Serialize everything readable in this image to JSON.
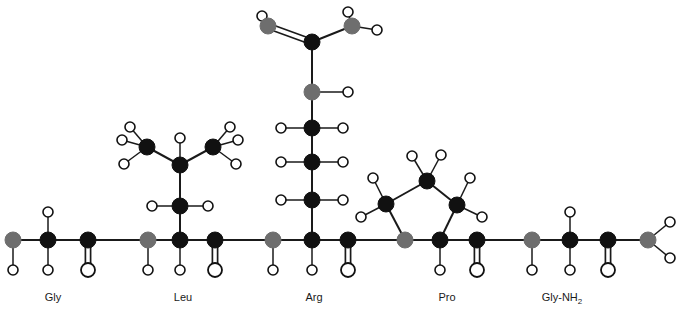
{
  "figure": {
    "width": 679,
    "height": 313,
    "background": "#ffffff"
  },
  "style": {
    "carbon_color": "#111111",
    "nitrogen_color": "#6e6e6e",
    "nitrogen_dark_color": "#4a4a4a",
    "hydrogen_fill": "#ffffff",
    "hydrogen_stroke": "#111111",
    "oxygen_fill": "#ffffff",
    "oxygen_stroke": "#111111",
    "bond_color": "#1a1a1a",
    "carbon_radius": 8,
    "nitrogen_radius": 8,
    "hydrogen_radius": 5,
    "oxygen_radius": 7,
    "bond_width": 2
  },
  "labels": [
    {
      "id": "label-gly",
      "text": "Gly",
      "sub": "",
      "x": 53,
      "y": 301
    },
    {
      "id": "label-leu",
      "text": "Leu",
      "sub": "",
      "x": 183,
      "y": 301
    },
    {
      "id": "label-arg",
      "text": "Arg",
      "sub": "",
      "x": 314,
      "y": 301
    },
    {
      "id": "label-pro",
      "text": "Pro",
      "sub": "",
      "x": 447,
      "y": 301
    },
    {
      "id": "label-gly-nh2",
      "text": "Gly-NH",
      "sub": "2",
      "x": 562,
      "y": 301
    }
  ],
  "atoms": [
    {
      "id": "n-term-n",
      "element": "N",
      "x": 13,
      "y": 240,
      "name": "n-terminal-nitrogen"
    },
    {
      "id": "gly-ca",
      "element": "C",
      "x": 48,
      "y": 240,
      "name": "gly-alpha-carbon"
    },
    {
      "id": "gly-co",
      "element": "C",
      "x": 88,
      "y": 240,
      "name": "gly-carbonyl-carbon"
    },
    {
      "id": "gly-o",
      "element": "O",
      "x": 88,
      "y": 270,
      "name": "gly-carbonyl-oxygen"
    },
    {
      "id": "leu-n",
      "element": "N",
      "x": 148,
      "y": 240,
      "name": "leu-amide-nitrogen"
    },
    {
      "id": "leu-ca",
      "element": "C",
      "x": 180,
      "y": 240,
      "name": "leu-alpha-carbon"
    },
    {
      "id": "leu-co",
      "element": "C",
      "x": 215,
      "y": 240,
      "name": "leu-carbonyl-carbon"
    },
    {
      "id": "leu-o",
      "element": "O",
      "x": 215,
      "y": 270,
      "name": "leu-carbonyl-oxygen"
    },
    {
      "id": "leu-cb",
      "element": "C",
      "x": 180,
      "y": 206,
      "name": "leu-beta-carbon"
    },
    {
      "id": "leu-cg",
      "element": "C",
      "x": 180,
      "y": 165,
      "name": "leu-gamma-carbon"
    },
    {
      "id": "leu-cd1",
      "element": "C",
      "x": 147,
      "y": 147,
      "name": "leu-delta1-methyl-carbon"
    },
    {
      "id": "leu-cd2",
      "element": "C",
      "x": 213,
      "y": 147,
      "name": "leu-delta2-methyl-carbon"
    },
    {
      "id": "arg-n",
      "element": "N",
      "x": 273,
      "y": 240,
      "name": "arg-amide-nitrogen"
    },
    {
      "id": "arg-ca",
      "element": "C",
      "x": 312,
      "y": 240,
      "name": "arg-alpha-carbon"
    },
    {
      "id": "arg-co",
      "element": "C",
      "x": 348,
      "y": 240,
      "name": "arg-carbonyl-carbon"
    },
    {
      "id": "arg-o",
      "element": "O",
      "x": 348,
      "y": 270,
      "name": "arg-carbonyl-oxygen"
    },
    {
      "id": "arg-cb",
      "element": "C",
      "x": 312,
      "y": 200,
      "name": "arg-beta-carbon"
    },
    {
      "id": "arg-cg",
      "element": "C",
      "x": 312,
      "y": 162,
      "name": "arg-gamma-carbon"
    },
    {
      "id": "arg-cd",
      "element": "C",
      "x": 312,
      "y": 128,
      "name": "arg-delta-carbon"
    },
    {
      "id": "arg-ne",
      "element": "N",
      "x": 312,
      "y": 92,
      "name": "arg-epsilon-nitrogen"
    },
    {
      "id": "arg-cz",
      "element": "C",
      "x": 312,
      "y": 42,
      "name": "arg-zeta-guanidinium-carbon"
    },
    {
      "id": "arg-nh1",
      "element": "N",
      "x": 268,
      "y": 26,
      "name": "arg-nh1-nitrogen"
    },
    {
      "id": "arg-nh2",
      "element": "N",
      "x": 352,
      "y": 26,
      "name": "arg-nh2-nitrogen"
    },
    {
      "id": "pro-n",
      "element": "N",
      "x": 405,
      "y": 240,
      "name": "pro-ring-nitrogen"
    },
    {
      "id": "pro-ca",
      "element": "C",
      "x": 440,
      "y": 240,
      "name": "pro-alpha-carbon"
    },
    {
      "id": "pro-co",
      "element": "C",
      "x": 477,
      "y": 240,
      "name": "pro-carbonyl-carbon"
    },
    {
      "id": "pro-o",
      "element": "O",
      "x": 477,
      "y": 270,
      "name": "pro-carbonyl-oxygen"
    },
    {
      "id": "pro-cd",
      "element": "C",
      "x": 386,
      "y": 204,
      "name": "pro-delta-carbon"
    },
    {
      "id": "pro-cg",
      "element": "C",
      "x": 427,
      "y": 181,
      "name": "pro-gamma-carbon"
    },
    {
      "id": "pro-cb",
      "element": "C",
      "x": 457,
      "y": 205,
      "name": "pro-beta-carbon"
    },
    {
      "id": "gly2-n",
      "element": "N",
      "x": 532,
      "y": 240,
      "name": "gly2-amide-nitrogen"
    },
    {
      "id": "gly2-ca",
      "element": "C",
      "x": 570,
      "y": 240,
      "name": "gly2-alpha-carbon"
    },
    {
      "id": "gly2-co",
      "element": "C",
      "x": 608,
      "y": 240,
      "name": "gly2-carbonyl-carbon"
    },
    {
      "id": "gly2-o",
      "element": "O",
      "x": 608,
      "y": 270,
      "name": "gly2-carbonyl-oxygen"
    },
    {
      "id": "c-term-n",
      "element": "N",
      "x": 648,
      "y": 240,
      "name": "c-terminal-amide-nitrogen"
    }
  ],
  "hydrogens": [
    {
      "id": "h-nterm",
      "x": 13,
      "y": 270,
      "parent": "n-term-n",
      "name": "hydrogen-n-terminal"
    },
    {
      "id": "h-gly-ca-up",
      "x": 48,
      "y": 212,
      "parent": "gly-ca",
      "name": "hydrogen-gly-alpha-up"
    },
    {
      "id": "h-gly-ca-dn",
      "x": 48,
      "y": 270,
      "parent": "gly-ca",
      "name": "hydrogen-gly-alpha-down"
    },
    {
      "id": "h-leu-n",
      "x": 148,
      "y": 270,
      "parent": "leu-n",
      "name": "hydrogen-leu-amide"
    },
    {
      "id": "h-leu-ca",
      "x": 180,
      "y": 270,
      "parent": "leu-ca",
      "name": "hydrogen-leu-alpha"
    },
    {
      "id": "h-leu-cb-l",
      "x": 152,
      "y": 206,
      "parent": "leu-cb",
      "name": "hydrogen-leu-beta-left"
    },
    {
      "id": "h-leu-cb-r",
      "x": 208,
      "y": 206,
      "parent": "leu-cb",
      "name": "hydrogen-leu-beta-right"
    },
    {
      "id": "h-leu-cg",
      "x": 180,
      "y": 138,
      "parent": "leu-cg",
      "name": "hydrogen-leu-gamma"
    },
    {
      "id": "h-leu-cd1-a",
      "x": 130,
      "y": 127,
      "parent": "leu-cd1",
      "name": "hydrogen-leu-delta1-a"
    },
    {
      "id": "h-leu-cd1-b",
      "x": 122,
      "y": 140,
      "parent": "leu-cd1",
      "name": "hydrogen-leu-delta1-b"
    },
    {
      "id": "h-leu-cd1-c",
      "x": 124,
      "y": 164,
      "parent": "leu-cd1",
      "name": "hydrogen-leu-delta1-c"
    },
    {
      "id": "h-leu-cd2-a",
      "x": 230,
      "y": 127,
      "parent": "leu-cd2",
      "name": "hydrogen-leu-delta2-a"
    },
    {
      "id": "h-leu-cd2-b",
      "x": 238,
      "y": 140,
      "parent": "leu-cd2",
      "name": "hydrogen-leu-delta2-b"
    },
    {
      "id": "h-leu-cd2-c",
      "x": 236,
      "y": 164,
      "parent": "leu-cd2",
      "name": "hydrogen-leu-delta2-c"
    },
    {
      "id": "h-arg-n",
      "x": 273,
      "y": 270,
      "parent": "arg-n",
      "name": "hydrogen-arg-amide"
    },
    {
      "id": "h-arg-ca",
      "x": 312,
      "y": 270,
      "parent": "arg-ca",
      "name": "hydrogen-arg-alpha"
    },
    {
      "id": "h-arg-cb-l",
      "x": 281,
      "y": 200,
      "parent": "arg-cb",
      "name": "hydrogen-arg-beta-left"
    },
    {
      "id": "h-arg-cb-r",
      "x": 343,
      "y": 200,
      "parent": "arg-cb",
      "name": "hydrogen-arg-beta-right"
    },
    {
      "id": "h-arg-cg-l",
      "x": 281,
      "y": 162,
      "parent": "arg-cg",
      "name": "hydrogen-arg-gamma-left"
    },
    {
      "id": "h-arg-cg-r",
      "x": 343,
      "y": 162,
      "parent": "arg-cg",
      "name": "hydrogen-arg-gamma-right"
    },
    {
      "id": "h-arg-cd-l",
      "x": 281,
      "y": 128,
      "parent": "arg-cd",
      "name": "hydrogen-arg-delta-left"
    },
    {
      "id": "h-arg-cd-r",
      "x": 343,
      "y": 128,
      "parent": "arg-cd",
      "name": "hydrogen-arg-delta-right"
    },
    {
      "id": "h-arg-ne",
      "x": 348,
      "y": 92,
      "parent": "arg-ne",
      "name": "hydrogen-arg-epsilon"
    },
    {
      "id": "h-arg-nh1",
      "x": 262,
      "y": 16,
      "parent": "arg-nh1",
      "name": "hydrogen-arg-nh1"
    },
    {
      "id": "h-arg-nh2-a",
      "x": 348,
      "y": 12,
      "parent": "arg-nh2",
      "name": "hydrogen-arg-nh2-a"
    },
    {
      "id": "h-arg-nh2-b",
      "x": 377,
      "y": 30,
      "parent": "arg-nh2",
      "name": "hydrogen-arg-nh2-b"
    },
    {
      "id": "h-pro-ca",
      "x": 440,
      "y": 270,
      "parent": "pro-ca",
      "name": "hydrogen-pro-alpha"
    },
    {
      "id": "h-pro-cd-a",
      "x": 373,
      "y": 178,
      "parent": "pro-cd",
      "name": "hydrogen-pro-delta-a"
    },
    {
      "id": "h-pro-cd-b",
      "x": 361,
      "y": 217,
      "parent": "pro-cd",
      "name": "hydrogen-pro-delta-b"
    },
    {
      "id": "h-pro-cg-a",
      "x": 412,
      "y": 156,
      "parent": "pro-cg",
      "name": "hydrogen-pro-gamma-a"
    },
    {
      "id": "h-pro-cg-b",
      "x": 441,
      "y": 155,
      "parent": "pro-cg",
      "name": "hydrogen-pro-gamma-b"
    },
    {
      "id": "h-pro-cb-a",
      "x": 470,
      "y": 178,
      "parent": "pro-cb",
      "name": "hydrogen-pro-beta-a"
    },
    {
      "id": "h-pro-cb-b",
      "x": 482,
      "y": 217,
      "parent": "pro-cb",
      "name": "hydrogen-pro-beta-b"
    },
    {
      "id": "h-gly2-n",
      "x": 532,
      "y": 270,
      "parent": "gly2-n",
      "name": "hydrogen-gly2-amide"
    },
    {
      "id": "h-gly2-ca-up",
      "x": 570,
      "y": 212,
      "parent": "gly2-ca",
      "name": "hydrogen-gly2-alpha-up"
    },
    {
      "id": "h-gly2-ca-dn",
      "x": 570,
      "y": 270,
      "parent": "gly2-ca",
      "name": "hydrogen-gly2-alpha-down"
    },
    {
      "id": "h-cterm-a",
      "x": 670,
      "y": 222,
      "parent": "c-term-n",
      "name": "hydrogen-c-terminal-a"
    },
    {
      "id": "h-cterm-b",
      "x": 670,
      "y": 258,
      "parent": "c-term-n",
      "name": "hydrogen-c-terminal-b"
    }
  ],
  "bonds": [
    {
      "a": "n-term-n",
      "b": "gly-ca",
      "order": 1,
      "name": "bond-nterm-glyca"
    },
    {
      "a": "gly-ca",
      "b": "gly-co",
      "order": 1,
      "name": "bond-glyca-glyco"
    },
    {
      "a": "gly-co",
      "b": "gly-o",
      "order": 2,
      "name": "bond-gly-carbonyl"
    },
    {
      "a": "gly-co",
      "b": "leu-n",
      "order": 1,
      "name": "bond-peptide-gly-leu"
    },
    {
      "a": "leu-n",
      "b": "leu-ca",
      "order": 1,
      "name": "bond-leun-leuca"
    },
    {
      "a": "leu-ca",
      "b": "leu-co",
      "order": 1,
      "name": "bond-leuca-leuco"
    },
    {
      "a": "leu-co",
      "b": "leu-o",
      "order": 2,
      "name": "bond-leu-carbonyl"
    },
    {
      "a": "leu-ca",
      "b": "leu-cb",
      "order": 1,
      "name": "bond-leuca-leucb"
    },
    {
      "a": "leu-cb",
      "b": "leu-cg",
      "order": 1,
      "name": "bond-leucb-leucg"
    },
    {
      "a": "leu-cg",
      "b": "leu-cd1",
      "order": 1,
      "name": "bond-leucg-leucd1"
    },
    {
      "a": "leu-cg",
      "b": "leu-cd2",
      "order": 1,
      "name": "bond-leucg-leucd2"
    },
    {
      "a": "leu-co",
      "b": "arg-n",
      "order": 1,
      "name": "bond-peptide-leu-arg"
    },
    {
      "a": "arg-n",
      "b": "arg-ca",
      "order": 1,
      "name": "bond-argn-argca"
    },
    {
      "a": "arg-ca",
      "b": "arg-co",
      "order": 1,
      "name": "bond-argca-argco"
    },
    {
      "a": "arg-co",
      "b": "arg-o",
      "order": 2,
      "name": "bond-arg-carbonyl"
    },
    {
      "a": "arg-ca",
      "b": "arg-cb",
      "order": 1,
      "name": "bond-argca-argcb"
    },
    {
      "a": "arg-cb",
      "b": "arg-cg",
      "order": 1,
      "name": "bond-argcb-argcg"
    },
    {
      "a": "arg-cg",
      "b": "arg-cd",
      "order": 1,
      "name": "bond-argcg-argcd"
    },
    {
      "a": "arg-cd",
      "b": "arg-ne",
      "order": 1,
      "name": "bond-argcd-argne"
    },
    {
      "a": "arg-ne",
      "b": "arg-cz",
      "order": 1,
      "name": "bond-argne-argcz"
    },
    {
      "a": "arg-cz",
      "b": "arg-nh1",
      "order": 2,
      "name": "bond-argcz-argnh1-double"
    },
    {
      "a": "arg-cz",
      "b": "arg-nh2",
      "order": 1,
      "name": "bond-argcz-argnh2"
    },
    {
      "a": "arg-co",
      "b": "pro-n",
      "order": 1,
      "name": "bond-peptide-arg-pro"
    },
    {
      "a": "pro-n",
      "b": "pro-ca",
      "order": 1,
      "name": "bond-pron-proca"
    },
    {
      "a": "pro-ca",
      "b": "pro-co",
      "order": 1,
      "name": "bond-proca-proco"
    },
    {
      "a": "pro-co",
      "b": "pro-o",
      "order": 2,
      "name": "bond-pro-carbonyl"
    },
    {
      "a": "pro-n",
      "b": "pro-cd",
      "order": 1,
      "name": "bond-pron-procd"
    },
    {
      "a": "pro-cd",
      "b": "pro-cg",
      "order": 1,
      "name": "bond-procd-procg"
    },
    {
      "a": "pro-cg",
      "b": "pro-cb",
      "order": 1,
      "name": "bond-procg-procb"
    },
    {
      "a": "pro-cb",
      "b": "pro-ca",
      "order": 1,
      "name": "bond-procb-proca"
    },
    {
      "a": "pro-co",
      "b": "gly2-n",
      "order": 1,
      "name": "bond-peptide-pro-gly2"
    },
    {
      "a": "gly2-n",
      "b": "gly2-ca",
      "order": 1,
      "name": "bond-gly2n-gly2ca"
    },
    {
      "a": "gly2-ca",
      "b": "gly2-co",
      "order": 1,
      "name": "bond-gly2ca-gly2co"
    },
    {
      "a": "gly2-co",
      "b": "gly2-o",
      "order": 2,
      "name": "bond-gly2-carbonyl"
    },
    {
      "a": "gly2-co",
      "b": "c-term-n",
      "order": 1,
      "name": "bond-gly2co-cterm"
    }
  ]
}
